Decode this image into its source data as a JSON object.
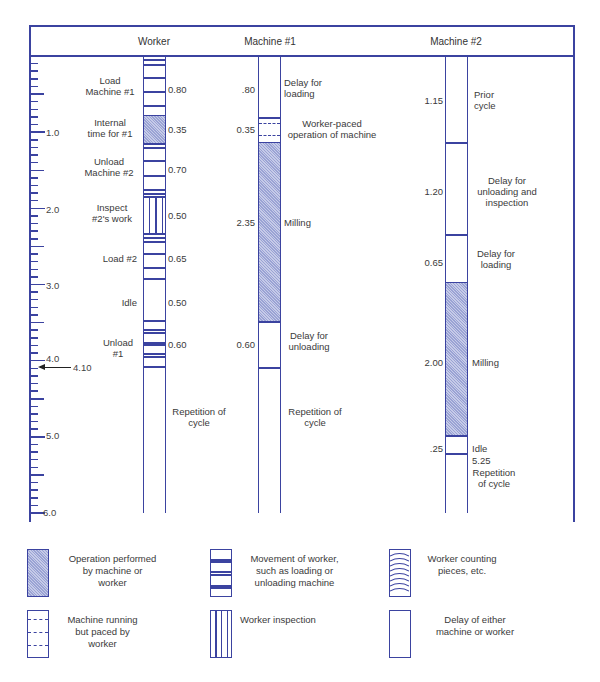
{
  "figure": {
    "columns": {
      "worker": "Worker",
      "machine1": "Machine #1",
      "machine2": "Machine #2"
    },
    "scale": {
      "labels": [
        "1.0",
        "2.0",
        "3.0",
        "4.0",
        "5.0",
        "6.0"
      ],
      "marker_value": "4.10"
    },
    "worker": {
      "activities": [
        {
          "label": "Load Machine #1",
          "line1": "Load",
          "line2": "Machine #1",
          "time": "0.80",
          "type": "movement"
        },
        {
          "label": "Internal time for #1",
          "line1": "Internal",
          "line2": "time for #1",
          "time": "0.35",
          "type": "operation"
        },
        {
          "label": "Unload Machine #2",
          "line1": "Unload",
          "line2": "Machine #2",
          "time": "0.70",
          "type": "movement"
        },
        {
          "label": "Inspect #2's work",
          "line1": "Inspect",
          "line2": "#2's work",
          "time": "0.50",
          "type": "inspection"
        },
        {
          "label": "Load #2",
          "line1": "Load #2",
          "line2": "",
          "time": "0.65",
          "type": "movement"
        },
        {
          "label": "Idle",
          "line1": "Idle",
          "line2": "",
          "time": "0.50",
          "type": "delay"
        },
        {
          "label": "Unload #1",
          "line1": "Unload",
          "line2": "#1",
          "time": "0.60",
          "type": "movement"
        }
      ],
      "repetition": {
        "line1": "Repetition of",
        "line2": "cycle"
      }
    },
    "machine1": {
      "activities": [
        {
          "line1": "Delay for",
          "line2": "loading",
          "time": ".80",
          "type": "delay"
        },
        {
          "line1": "Worker-paced",
          "line2": "operation of machine",
          "time": "0.35",
          "type": "machine-paced"
        },
        {
          "line1": "Milling",
          "line2": "",
          "time": "2.35",
          "type": "operation"
        },
        {
          "line1": "Delay for",
          "line2": "unloading",
          "time": "0.60",
          "type": "delay"
        }
      ],
      "repetition": {
        "line1": "Repetition of",
        "line2": "cycle"
      }
    },
    "machine2": {
      "activities": [
        {
          "line1": "Prior",
          "line2": "cycle",
          "line3": "",
          "time": "1.15",
          "type": "delay"
        },
        {
          "line1": "Delay for",
          "line2": "unloading and",
          "line3": "inspection",
          "time": "1.20",
          "type": "delay"
        },
        {
          "line1": "Delay for",
          "line2": "loading",
          "line3": "",
          "time": "0.65",
          "type": "delay"
        },
        {
          "line1": "Milling",
          "line2": "",
          "line3": "",
          "time": "2.00",
          "type": "operation"
        },
        {
          "line1": "Idle",
          "line2": "",
          "line3": "",
          "time": ".25",
          "type": "delay"
        }
      ],
      "end_time": "5.25",
      "repetition": {
        "line1": "Repetition",
        "line2": "of cycle"
      }
    }
  },
  "legend": [
    {
      "symbol": "operation",
      "line1": "Operation performed",
      "line2": "by machine or",
      "line3": "worker"
    },
    {
      "symbol": "movement",
      "line1": "Movement of worker,",
      "line2": "such as loading or",
      "line3": "unloading machine"
    },
    {
      "symbol": "counting",
      "line1": "Worker counting",
      "line2": "pieces, etc.",
      "line3": ""
    },
    {
      "symbol": "machine-paced",
      "line1": "Machine running",
      "line2": "but paced by",
      "line3": "worker"
    },
    {
      "symbol": "inspection",
      "line1": "Worker inspection",
      "line2": "",
      "line3": ""
    },
    {
      "symbol": "delay",
      "line1": "Delay of either",
      "line2": "machine or worker",
      "line3": ""
    }
  ],
  "colors": {
    "line": "#3b43a0",
    "shade": "#b4bbe0",
    "text": "#3a3a3a"
  }
}
